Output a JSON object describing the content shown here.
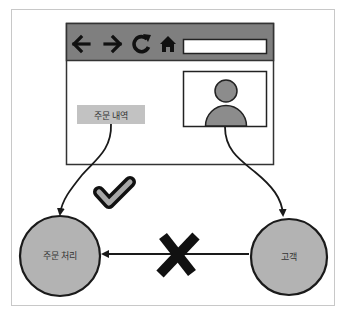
{
  "diagram": {
    "browser": {
      "toolbar_icons": [
        "back-arrow-icon",
        "forward-arrow-icon",
        "reload-icon",
        "home-icon"
      ],
      "address_bar_value": "",
      "order_history_button": {
        "label": "주문 내역"
      },
      "profile_panel": {
        "icon": "user-avatar-icon"
      }
    },
    "nodes": [
      {
        "id": "order-processing",
        "label": "주문 처리"
      },
      {
        "id": "customer",
        "label": "고객"
      }
    ],
    "edges": [
      {
        "from": "order-history-button",
        "to": "order-processing",
        "status": "allowed",
        "marker": "check-icon"
      },
      {
        "from": "profile-panel",
        "to": "customer",
        "status": "allowed"
      },
      {
        "from": "customer",
        "to": "order-processing",
        "status": "forbidden",
        "marker": "x-icon"
      }
    ],
    "colors": {
      "toolbar": "#7f7f7f",
      "node_fill": "#b3b3b3",
      "button_fill": "#c2c2c2",
      "stroke": "#1a1a1a",
      "frame": "#c8c8c8"
    }
  }
}
